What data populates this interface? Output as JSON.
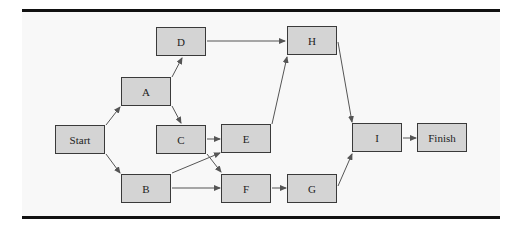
{
  "diagram": {
    "type": "activity-network",
    "colors": {
      "node_fill": "#d4d4d4",
      "node_border": "#3a3a3a",
      "edge": "#555555",
      "background": "#f8f8f8",
      "rule": "#111111"
    },
    "nodes": [
      {
        "id": "start",
        "label": "Start"
      },
      {
        "id": "a",
        "label": "A"
      },
      {
        "id": "b",
        "label": "B"
      },
      {
        "id": "c",
        "label": "C"
      },
      {
        "id": "d",
        "label": "D"
      },
      {
        "id": "e",
        "label": "E"
      },
      {
        "id": "f",
        "label": "F"
      },
      {
        "id": "g",
        "label": "G"
      },
      {
        "id": "h",
        "label": "H"
      },
      {
        "id": "i",
        "label": "I"
      },
      {
        "id": "finish",
        "label": "Finish"
      }
    ],
    "edges": [
      [
        "Start",
        "A"
      ],
      [
        "Start",
        "B"
      ],
      [
        "A",
        "D"
      ],
      [
        "A",
        "C"
      ],
      [
        "D",
        "H"
      ],
      [
        "C",
        "E"
      ],
      [
        "C",
        "F"
      ],
      [
        "B",
        "E"
      ],
      [
        "B",
        "F"
      ],
      [
        "E",
        "H"
      ],
      [
        "F",
        "G"
      ],
      [
        "H",
        "I"
      ],
      [
        "G",
        "I"
      ],
      [
        "I",
        "Finish"
      ]
    ]
  }
}
